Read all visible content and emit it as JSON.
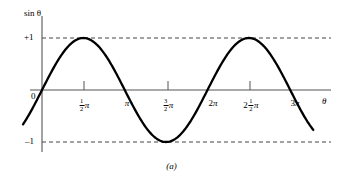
{
  "figure": {
    "caption": "(a)"
  },
  "axes": {
    "y_title": "sin θ",
    "x_title": "θ",
    "y_labels": {
      "plus_one": "+1",
      "minus_one": "–1",
      "zero": "0"
    }
  },
  "xticks": [
    {
      "label": "½π",
      "whole": "",
      "num": "1",
      "den": "2",
      "pi": "π",
      "x_value": 1.5707963,
      "has_tick_mark": true
    },
    {
      "label": "π",
      "whole": "",
      "num": "",
      "den": "",
      "pi": "π",
      "x_value": 3.1415927,
      "has_tick_mark": false
    },
    {
      "label": "3/2π",
      "whole": "",
      "num": "3",
      "den": "2",
      "pi": "π",
      "x_value": 4.712389,
      "has_tick_mark": true
    },
    {
      "label": "2π",
      "whole": "2",
      "num": "",
      "den": "",
      "pi": "π",
      "x_value": 6.2831853,
      "has_tick_mark": false
    },
    {
      "label": "2½π",
      "whole": "2",
      "num": "1",
      "den": "2",
      "pi": "π",
      "x_value": 7.8539816,
      "has_tick_mark": true
    },
    {
      "label": "3π",
      "whole": "3",
      "num": "",
      "den": "",
      "pi": "π",
      "x_value": 9.424778,
      "has_tick_mark": false
    }
  ],
  "chart_data": {
    "type": "line",
    "title": "",
    "subtitle": "(a)",
    "xlabel": "θ",
    "ylabel": "sin θ",
    "xlim": [
      -0.72,
      10.3
    ],
    "ylim": [
      -1.45,
      1.45
    ],
    "grid": false,
    "legend": null,
    "reference_lines": [
      {
        "y": 1,
        "label": "+1",
        "style": "dashed"
      },
      {
        "y": -1,
        "label": "–1",
        "style": "dashed"
      }
    ],
    "xtick_values": [
      1.5707963,
      3.1415927,
      4.712389,
      6.2831853,
      7.8539816,
      9.424778
    ],
    "xtick_labels": [
      "½π",
      "π",
      "3/2π",
      "2π",
      "2½π",
      "3π"
    ],
    "ytick_values": [
      1,
      0,
      -1
    ],
    "ytick_labels": [
      "+1",
      "0",
      "–1"
    ],
    "series": [
      {
        "name": "sin θ",
        "function": "sin(x)",
        "color": "#000000",
        "x": [
          -0.72,
          -0.5,
          -0.25,
          0,
          0.3927,
          0.7854,
          1.1781,
          1.5708,
          1.9635,
          2.3562,
          2.7489,
          3.1416,
          3.5343,
          3.927,
          4.3197,
          4.7124,
          5.1051,
          5.4978,
          5.8905,
          6.2832,
          6.6759,
          7.0686,
          7.4613,
          7.854,
          8.2467,
          8.6394,
          9.0321,
          9.4248,
          9.8175,
          10.2102,
          10.3
        ],
        "y": [
          -0.6594,
          -0.4794,
          -0.2474,
          0,
          0.3827,
          0.7071,
          0.9239,
          1,
          0.9239,
          0.7071,
          0.3827,
          0,
          -0.3827,
          -0.7071,
          -0.9239,
          -1,
          -0.9239,
          -0.7071,
          -0.3827,
          0,
          0.3827,
          0.7071,
          0.9239,
          1,
          0.9239,
          0.7071,
          0.3827,
          0,
          -0.3827,
          -0.7071,
          -0.7757
        ]
      }
    ],
    "key_points": {
      "maxima": [
        {
          "x": 1.5707963,
          "y": 1
        },
        {
          "x": 7.8539816,
          "y": 1
        }
      ],
      "minima": [
        {
          "x": 4.712389,
          "y": -1
        }
      ],
      "zero_crossings": [
        0,
        3.1415927,
        6.2831853,
        9.424778
      ]
    }
  },
  "style": {
    "curve_color": "#000000",
    "axis_color": "#555555",
    "dash_color": "#444444",
    "background": "#ffffff"
  }
}
